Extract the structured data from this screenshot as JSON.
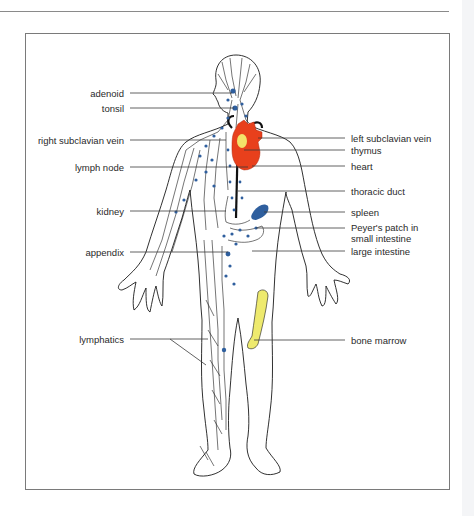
{
  "figure": {
    "colors": {
      "outline": "#1a1a1a",
      "lymph_node": "#2f5f9e",
      "heart": "#e8401c",
      "thymus": "#f3e36a",
      "spleen": "#2f5f9e",
      "bone_marrow": "#eeea6e",
      "frame": "#7a7a7a"
    },
    "labels_left": [
      {
        "id": "adenoid",
        "text": "adenoid"
      },
      {
        "id": "tonsil",
        "text": "tonsil"
      },
      {
        "id": "right-subclavian-vein",
        "text": "right subclavian vein"
      },
      {
        "id": "lymph-node",
        "text": "lymph node"
      },
      {
        "id": "kidney",
        "text": "kidney"
      },
      {
        "id": "appendix",
        "text": "appendix"
      },
      {
        "id": "lymphatics",
        "text": "lymphatics"
      }
    ],
    "labels_right": [
      {
        "id": "left-subclavian-vein",
        "text": "left subclavian vein"
      },
      {
        "id": "thymus",
        "text": "thymus"
      },
      {
        "id": "heart",
        "text": "heart"
      },
      {
        "id": "thoracic-duct",
        "text": "thoracic duct"
      },
      {
        "id": "spleen",
        "text": "spleen"
      },
      {
        "id": "peyers-patch",
        "text": "Peyer's patch in"
      },
      {
        "id": "peyers-patch-2",
        "text": "small intestine"
      },
      {
        "id": "large-intestine",
        "text": "large intestine"
      },
      {
        "id": "bone-marrow",
        "text": "bone marrow"
      }
    ]
  }
}
